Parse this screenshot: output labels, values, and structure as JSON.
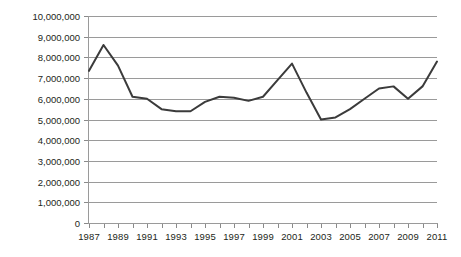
{
  "chart_data": {
    "type": "line",
    "title": "",
    "subtitle": "",
    "xlabel": "",
    "ylabel": "",
    "grid": "horizontal",
    "legend": "none",
    "xlim": [
      1987,
      2011
    ],
    "ylim": [
      0,
      10000000
    ],
    "ytick_step": 1000000,
    "x": [
      1987,
      1988,
      1989,
      1990,
      1991,
      1992,
      1993,
      1994,
      1995,
      1996,
      1997,
      1998,
      1999,
      2000,
      2001,
      2002,
      2003,
      2004,
      2005,
      2006,
      2007,
      2008,
      2009,
      2010,
      2011
    ],
    "y_tick_labels": [
      "0",
      "1,000,000",
      "2,000,000",
      "3,000,000",
      "4,000,000",
      "5,000,000",
      "6,000,000",
      "7,000,000",
      "8,000,000",
      "9,000,000",
      "10,000,000"
    ],
    "y_tick_values": [
      0,
      1000000,
      2000000,
      3000000,
      4000000,
      5000000,
      6000000,
      7000000,
      8000000,
      9000000,
      10000000
    ],
    "x_tick_labels": [
      "1987",
      "",
      "1989",
      "",
      "1991",
      "",
      "1993",
      "",
      "1995",
      "",
      "1997",
      "",
      "1999",
      "",
      "2001",
      "",
      "2003",
      "",
      "2005",
      "",
      "2007",
      "",
      "2009",
      "",
      "2011"
    ],
    "series": [
      {
        "name": "series-1",
        "color": "#3b3b3b",
        "line_width": 2,
        "values": [
          7350000,
          8600000,
          7600000,
          6100000,
          6000000,
          5500000,
          5400000,
          5400000,
          5850000,
          6100000,
          6050000,
          5900000,
          6100000,
          6900000,
          7700000,
          6300000,
          5000000,
          5100000,
          5500000,
          6000000,
          6500000,
          6600000,
          6000000,
          6600000,
          7800000
        ]
      }
    ],
    "colors": {
      "line": "#3b3b3b",
      "grid": "#9a9a9a",
      "axis": "#9a9a9a",
      "text": "#231f20",
      "background": "#ffffff"
    }
  }
}
